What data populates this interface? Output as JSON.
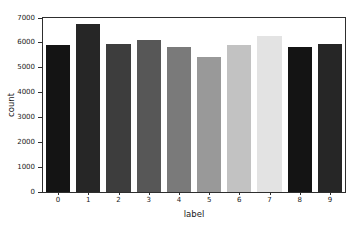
{
  "chart_data": {
    "type": "bar",
    "title": "",
    "xlabel": "label",
    "ylabel": "count",
    "categories": [
      "0",
      "1",
      "2",
      "3",
      "4",
      "5",
      "6",
      "7",
      "8",
      "9"
    ],
    "values": [
      5923,
      6742,
      5958,
      6131,
      5842,
      5421,
      5918,
      6265,
      5851,
      5949
    ],
    "ylim": [
      0,
      7000
    ],
    "yticks": [
      0,
      1000,
      2000,
      3000,
      4000,
      5000,
      6000,
      7000
    ],
    "grid": "off",
    "legend": "none",
    "bar_colors": [
      "#141414",
      "#262626",
      "#3d3d3d",
      "#575757",
      "#7a7a7a",
      "#999999",
      "#c2c2c2",
      "#e3e3e3",
      "#141414",
      "#262626"
    ],
    "spine_color": "#2e2e2e",
    "background_color": "#ffffff",
    "text_color": "#1a1a1a"
  }
}
